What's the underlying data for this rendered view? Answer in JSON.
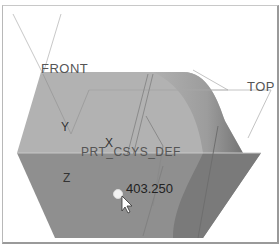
{
  "viewport": {
    "datum_planes": [
      {
        "name": "FRONT"
      },
      {
        "name": "TOP"
      }
    ],
    "csys": {
      "name": "PRT_CSYS_DEF",
      "axes": [
        "X",
        "Y",
        "Z"
      ]
    },
    "dimension": {
      "value": "403.250"
    },
    "colors": {
      "top_face": "#b4b4b4",
      "front_face": "#8e8e8e",
      "side_face": "#7e7e7e",
      "datum_line": "#bdbdbd",
      "background": "#ffffff"
    }
  }
}
